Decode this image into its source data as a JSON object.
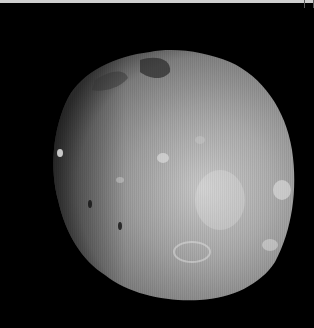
{
  "image": {
    "subject": "Phobos",
    "description": "Grayscale photograph of an irregular cratered moon against black space",
    "background_color": "#000000",
    "surface_color_light": "#d8d8d8",
    "surface_color_mid": "#9a9a9a",
    "surface_color_dark": "#3a3a3a"
  }
}
